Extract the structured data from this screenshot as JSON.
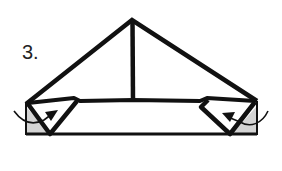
{
  "diagram": {
    "type": "origami-folding-step",
    "step_label": "3.",
    "colors": {
      "line": "#111111",
      "background": "#ffffff",
      "shaded_paper": "#d4d4d4"
    },
    "elements": [
      {
        "id": "triangle-outline",
        "description": "Large triangle folded paper, apex at top"
      },
      {
        "id": "center-crease",
        "description": "Vertical center line from apex to band"
      },
      {
        "id": "bottom-band",
        "description": "Horizontal rectangular band along the base"
      },
      {
        "id": "left-flap",
        "description": "Left corner flap folded inward, with shaded underside"
      },
      {
        "id": "right-flap",
        "description": "Right corner flap folded inward, with shaded underside"
      },
      {
        "id": "left-fold-arrow",
        "description": "Curved arrow indicating tuck of left corner"
      },
      {
        "id": "right-fold-arrow",
        "description": "Curved arrow indicating tuck of right corner"
      }
    ]
  }
}
